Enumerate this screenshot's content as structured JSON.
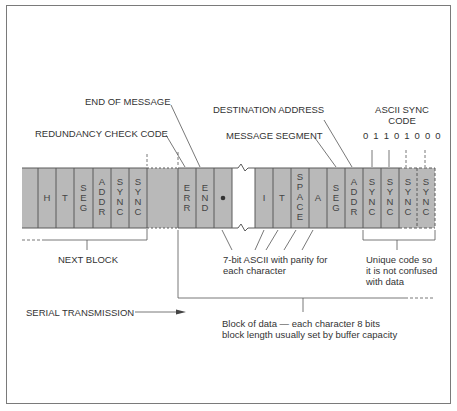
{
  "labels": {
    "end_of_message": "END OF MESSAGE",
    "redundancy_check_code": "REDUNDANCY CHECK CODE",
    "destination_address": "DESTINATION ADDRESS",
    "message_segment": "MESSAGE SEGMENT",
    "ascii_sync_code_title": "ASCII SYNC\nCODE",
    "ascii_sync_bits": "0 1 1 0 1 0 0 0",
    "next_block": "NEXT BLOCK",
    "ascii_parity": "7-bit ASCII with parity for\neach character",
    "unique_code": "Unique code so\nit is not confused\nwith data",
    "serial_transmission": "SERIAL TRANSMISSION",
    "block_of_data": "Block of data — each character 8 bits\nblock length usually set by buffer capacity"
  },
  "cells": {
    "left_block": [
      "",
      "H",
      "T",
      "SEG",
      "ADDR",
      "SYNC",
      "SYNC"
    ],
    "current_block_start": [
      "ERR",
      "END",
      "•"
    ],
    "current_block_end": [
      "I",
      "T",
      "SPACE",
      "A",
      "SEG",
      "ADDR",
      "SYNC",
      "SYNC",
      "SYNC",
      "SYNC"
    ]
  },
  "colors": {
    "cell_fill": "#b9b9b9",
    "cell_border": "#5a5a5a",
    "line": "#555555",
    "frame": "#7a7a7a"
  }
}
